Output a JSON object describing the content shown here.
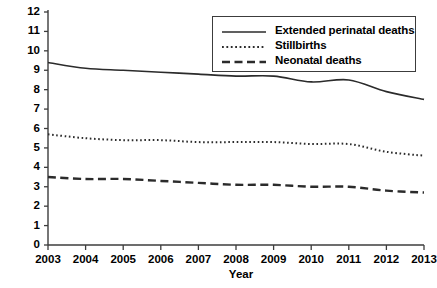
{
  "chart_data": {
    "type": "line",
    "title": "",
    "xlabel": "Year",
    "ylabel": "Deaths per 1,000 births",
    "ylabel_superscript": "*",
    "xlim": [
      2003,
      2013
    ],
    "ylim": [
      0,
      12
    ],
    "ytick_step": 1,
    "grid": false,
    "legend_position": "top-right",
    "x": [
      2003,
      2004,
      2005,
      2006,
      2007,
      2008,
      2009,
      2010,
      2011,
      2012,
      2013
    ],
    "categories": [
      "2003",
      "2004",
      "2005",
      "2006",
      "2007",
      "2008",
      "2009",
      "2010",
      "2011",
      "2012",
      "2013"
    ],
    "yticks": [
      "0",
      "1",
      "2",
      "3",
      "4",
      "5",
      "6",
      "7",
      "8",
      "9",
      "10",
      "11",
      "12"
    ],
    "series": [
      {
        "name": "Extended perinatal deaths",
        "style": "solid",
        "values": [
          9.4,
          9.1,
          9.0,
          8.9,
          8.8,
          8.7,
          8.7,
          8.4,
          8.5,
          7.9,
          7.5
        ]
      },
      {
        "name": "Stillbirths",
        "style": "dotted",
        "values": [
          5.7,
          5.5,
          5.4,
          5.4,
          5.3,
          5.3,
          5.3,
          5.2,
          5.2,
          4.8,
          4.6
        ]
      },
      {
        "name": "Neonatal deaths",
        "style": "dashed",
        "values": [
          3.5,
          3.4,
          3.4,
          3.3,
          3.2,
          3.1,
          3.1,
          3.0,
          3.0,
          2.8,
          2.7
        ]
      }
    ]
  },
  "legend": {
    "items": [
      {
        "label": "Extended perinatal deaths",
        "style": "solid"
      },
      {
        "label": "Stillbirths",
        "style": "dotted"
      },
      {
        "label": "Neonatal deaths",
        "style": "dashed"
      }
    ]
  },
  "axes": {
    "x_title": "Year",
    "y_title": "Deaths per 1,000 births",
    "y_title_superscript": "*"
  },
  "colors": {
    "line": "#2b2b2b",
    "axis": "#3c3c3c",
    "background": "#ffffff",
    "text": "#000000"
  }
}
